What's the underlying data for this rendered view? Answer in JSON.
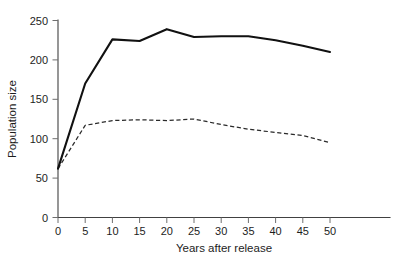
{
  "chart_data": {
    "type": "line",
    "title": "",
    "xlabel": "Years after release",
    "ylabel": "Population size",
    "xlim": [
      0,
      50
    ],
    "ylim": [
      0,
      250
    ],
    "grid": false,
    "legend": "none",
    "x": [
      0,
      5,
      10,
      15,
      20,
      25,
      30,
      35,
      40,
      45,
      50
    ],
    "xticks": [
      "0",
      "5",
      "10",
      "15",
      "20",
      "25",
      "30",
      "35",
      "40",
      "45",
      "50"
    ],
    "yticks": [
      "0",
      "50",
      "100",
      "150",
      "200",
      "250"
    ],
    "series": [
      {
        "name": "solid-series",
        "style": "solid",
        "color": "#111111",
        "values": [
          62,
          170,
          226,
          224,
          239,
          229,
          230,
          230,
          225,
          218,
          210
        ]
      },
      {
        "name": "dashed-series",
        "style": "dashed",
        "color": "#2a2a2a",
        "values": [
          62,
          117,
          123,
          124,
          123,
          125,
          118,
          112,
          108,
          104,
          95
        ]
      }
    ]
  },
  "axis": {
    "x_title": "Years after release",
    "y_title": "Population size"
  }
}
